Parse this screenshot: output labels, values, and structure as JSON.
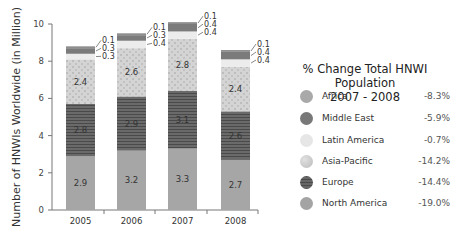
{
  "chart_data": {
    "type": "bar",
    "stacked": true,
    "title": "",
    "xlabel": "",
    "ylabel": "Number of HNWIs Worldwide (in Million)",
    "ylim": [
      0,
      10
    ],
    "yticks": [
      0,
      2,
      4,
      6,
      8,
      10
    ],
    "categories": [
      "2005",
      "2006",
      "2007",
      "2008"
    ],
    "series": [
      {
        "name": "North America",
        "values": [
          2.9,
          3.2,
          3.3,
          2.7
        ],
        "color": "#a6a6a6"
      },
      {
        "name": "Europe",
        "values": [
          2.8,
          2.9,
          3.1,
          2.6
        ],
        "color": "#5e5e5e"
      },
      {
        "name": "Asia-Pacific",
        "values": [
          2.4,
          2.6,
          2.8,
          2.4
        ],
        "color": "#cfcfcf"
      },
      {
        "name": "Latin America",
        "values": [
          0.3,
          0.4,
          0.4,
          0.4
        ],
        "color": "#ececec"
      },
      {
        "name": "Middle East",
        "values": [
          0.3,
          0.3,
          0.4,
          0.4
        ],
        "color": "#7b7b7b"
      },
      {
        "name": "Africa",
        "values": [
          0.1,
          0.1,
          0.1,
          0.1
        ],
        "color": "#9a9a9a"
      }
    ],
    "bar_labels": {
      "North America": [
        "2.9",
        "3.2",
        "3.3",
        "2.7"
      ],
      "Europe": [
        "2.8",
        "2.9",
        "3.1",
        "2.6"
      ],
      "Asia-Pacific": [
        "2.4",
        "2.6",
        "2.8",
        "2.4"
      ],
      "Latin America": [
        "0.3",
        "0.4",
        "0.4",
        "0.4"
      ],
      "Middle East": [
        "0.3",
        "0.3",
        "0.4",
        "0.4"
      ],
      "Africa": [
        "0.1",
        "0.1",
        "0.1",
        "0.1"
      ]
    },
    "legend": {
      "title_line1": "% Change Total HNWI Population",
      "title_line2": "2007 - 2008",
      "position": "right",
      "entries": [
        {
          "name": "Africa",
          "change": "-8.3%",
          "color": "#a9a9a9"
        },
        {
          "name": "Middle East",
          "change": "-5.9%",
          "color": "#787878"
        },
        {
          "name": "Latin America",
          "change": "-0.7%",
          "color": "#e6e6e6"
        },
        {
          "name": "Asia-Pacific",
          "change": "-14.2%",
          "color": "#cdcdcd"
        },
        {
          "name": "Europe",
          "change": "-14.4%",
          "color": "#5a5a5a"
        },
        {
          "name": "North America",
          "change": "-19.0%",
          "color": "#a4a4a4"
        }
      ]
    },
    "grid": false
  }
}
